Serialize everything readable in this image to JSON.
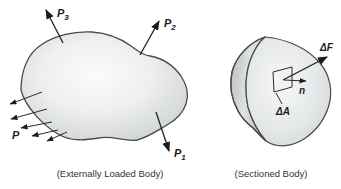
{
  "figure": {
    "left": {
      "caption": "(Externally Loaded Body)",
      "force_labels": {
        "p3": {
          "base": "P",
          "sub": "3"
        },
        "p2": {
          "base": "P",
          "sub": "2"
        },
        "p1": {
          "base": "P",
          "sub": "1"
        },
        "p_distributed": "P"
      }
    },
    "right": {
      "caption": "(Sectioned Body)",
      "labels": {
        "delta_f": "ΔF",
        "normal": "n",
        "delta_a": "ΔA"
      }
    },
    "colors": {
      "background": "#ffffff",
      "outline": "#4a4a4a",
      "arrow": "#222222",
      "body_fill_center": "#fafafa",
      "body_fill_edge": "#c7cccc",
      "crescent_fill": "#bcc2c2",
      "text": "#1c1c1c",
      "caption_text": "#333333"
    }
  }
}
